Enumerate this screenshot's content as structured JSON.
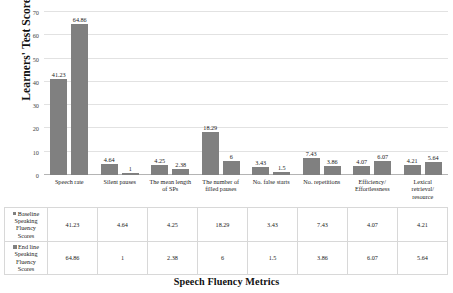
{
  "chart_data": {
    "type": "bar",
    "title": "",
    "xlabel": "Speech Fluency Metrics",
    "ylabel": "Learners' Test Scores",
    "ylim": [
      0,
      70
    ],
    "yticks": [
      0,
      10,
      20,
      30,
      40,
      50,
      60,
      70
    ],
    "grid": true,
    "legend_position": "table-row-headers",
    "bar_color": "#808080",
    "categories": [
      "Speech rate",
      "Silent pauses",
      "The mean length of SPs",
      "The number of filled pauses",
      "No. false starts",
      "No. repetitions",
      "Efficiency/ Effortlessness",
      "Lexical retrieval/ resource"
    ],
    "category_lines": [
      [
        "Speech rate"
      ],
      [
        "Silent pauses"
      ],
      [
        "The mean length",
        "of SPs"
      ],
      [
        "The number of",
        "filled pauses"
      ],
      [
        "No. false starts"
      ],
      [
        "No. repetitions"
      ],
      [
        "Efficiency/",
        "Effortlessness"
      ],
      [
        "Lexical",
        "retrieval/",
        "resource"
      ]
    ],
    "series": [
      {
        "name": "Baseline Speaking Fluency Scores",
        "name_lines": [
          "Baseline",
          "Speaking",
          "Fluency",
          "Scores"
        ],
        "values": [
          41.23,
          4.64,
          4.25,
          18.29,
          3.43,
          7.43,
          4.07,
          4.21
        ],
        "labels": [
          "41.23",
          "4.64",
          "4.25",
          "18.29",
          "3.43",
          "7.43",
          "4.07",
          "4.21"
        ]
      },
      {
        "name": "End line Speaking Fluency Scores",
        "name_lines": [
          "End line",
          "Speaking",
          "Fluency",
          "Scores"
        ],
        "values": [
          64.86,
          1,
          2.38,
          6,
          1.5,
          3.86,
          6.07,
          5.64
        ],
        "labels": [
          "64.86",
          "1",
          "2.38",
          "6",
          "1.5",
          "3.86",
          "6.07",
          "5.64"
        ]
      }
    ]
  },
  "axis": {
    "y_title": "Learners' Test Scores",
    "x_title": "Speech Fluency Metrics",
    "y_ticks": [
      "0",
      "10",
      "20",
      "30",
      "40",
      "50",
      "60",
      "70"
    ]
  },
  "table": {
    "row0_header_lines": [
      "Baseline",
      "Speaking",
      "Fluency",
      "Scores"
    ],
    "row1_header_lines": [
      "End line",
      "Speaking",
      "Fluency",
      "Scores"
    ],
    "row0": [
      "41.23",
      "4.64",
      "4.25",
      "18.29",
      "3.43",
      "7.43",
      "4.07",
      "4.21"
    ],
    "row1": [
      "64.86",
      "1",
      "2.38",
      "6",
      "1.5",
      "3.86",
      "6.07",
      "5.64"
    ]
  }
}
